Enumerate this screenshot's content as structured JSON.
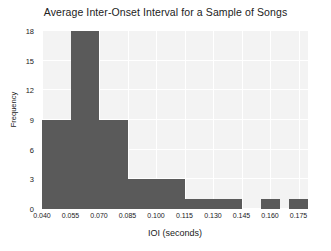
{
  "chart_data": {
    "type": "bar",
    "title": "Average Inter-Onset Interval for a Sample of Songs",
    "xlabel": "IOI (seconds)",
    "ylabel": "Frequency",
    "xlim": [
      0.04,
      0.18
    ],
    "ylim": [
      0,
      18
    ],
    "grid": true,
    "legend": null,
    "bin_width": 0.005,
    "bar_color": "#5a5a5a",
    "plot_background": "#f3f3f3",
    "grid_color": "#ffffff",
    "xticks": [
      "0.040",
      "0.055",
      "0.070",
      "0.085",
      "0.100",
      "0.115",
      "0.130",
      "0.145",
      "0.160",
      "0.175"
    ],
    "xtick_values": [
      0.04,
      0.055,
      0.07,
      0.085,
      0.1,
      0.115,
      0.13,
      0.145,
      0.16,
      0.175
    ],
    "yticks": [
      "0",
      "3",
      "6",
      "9",
      "12",
      "15",
      "18"
    ],
    "ytick_values": [
      0,
      3,
      6,
      9,
      12,
      15,
      18
    ],
    "bins": [
      {
        "x0": 0.04,
        "x1": 0.055,
        "value": 9
      },
      {
        "x0": 0.055,
        "x1": 0.07,
        "value": 18
      },
      {
        "x0": 0.07,
        "x1": 0.085,
        "value": 9
      },
      {
        "x0": 0.085,
        "x1": 0.1,
        "value": 3
      },
      {
        "x0": 0.1,
        "x1": 0.115,
        "value": 3
      },
      {
        "x0": 0.115,
        "x1": 0.145,
        "value": 1
      },
      {
        "x0": 0.155,
        "x1": 0.165,
        "value": 1
      },
      {
        "x0": 0.17,
        "x1": 0.18,
        "value": 1
      }
    ],
    "categories": [
      "0.040-0.055",
      "0.055-0.070",
      "0.070-0.085",
      "0.085-0.100",
      "0.100-0.115",
      "0.115-0.145",
      "0.155-0.165",
      "0.170-0.180"
    ],
    "values": [
      9,
      18,
      9,
      3,
      3,
      1,
      1,
      1
    ]
  }
}
